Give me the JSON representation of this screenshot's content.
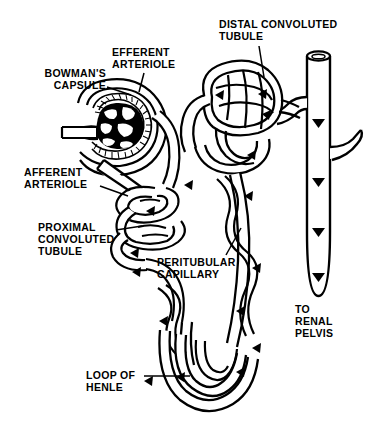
{
  "figure": {
    "background_color": "#ffffff",
    "ink_color": "#000000",
    "width": 369,
    "height": 421
  },
  "labels": {
    "bowmans_capsule": "BOWMAN'S\nCAPSULE",
    "efferent_arteriole": "EFFERENT\nARTERIOLE",
    "distal_convoluted_tubule": "DISTAL CONVOLUTED\nTUBULE",
    "afferent_arteriole": "AFFERENT\nARTERIOLE",
    "proximal_convoluted_tubule": "PROXIMAL\nCONVOLUTED\nTUBULE",
    "peritubular_capillary": "PERITUBULAR\nCAPILLARY",
    "to_renal_pelvis": "TO\nRENAL\nPELVIS",
    "loop_of_henle": "LOOP OF\nHENLE"
  },
  "structures": {
    "glomerulus": "glomerulus-capillary-tuft",
    "bowmans_capsule": "bowmans-capsule-cup",
    "afferent_arteriole": "afferent-arteriole-vessel",
    "efferent_arteriole": "efferent-arteriole-vessel",
    "proximal_convoluted_tubule": "proximal-convoluted-tubule-coil",
    "distal_convoluted_tubule": "distal-convoluted-tubule-coil",
    "loop_of_henle": "loop-of-henle-hairpin",
    "peritubular_capillary": "peritubular-capillary-network",
    "collecting_duct": "collecting-duct-tube",
    "flow_arrows": "flow-direction-arrowheads"
  }
}
